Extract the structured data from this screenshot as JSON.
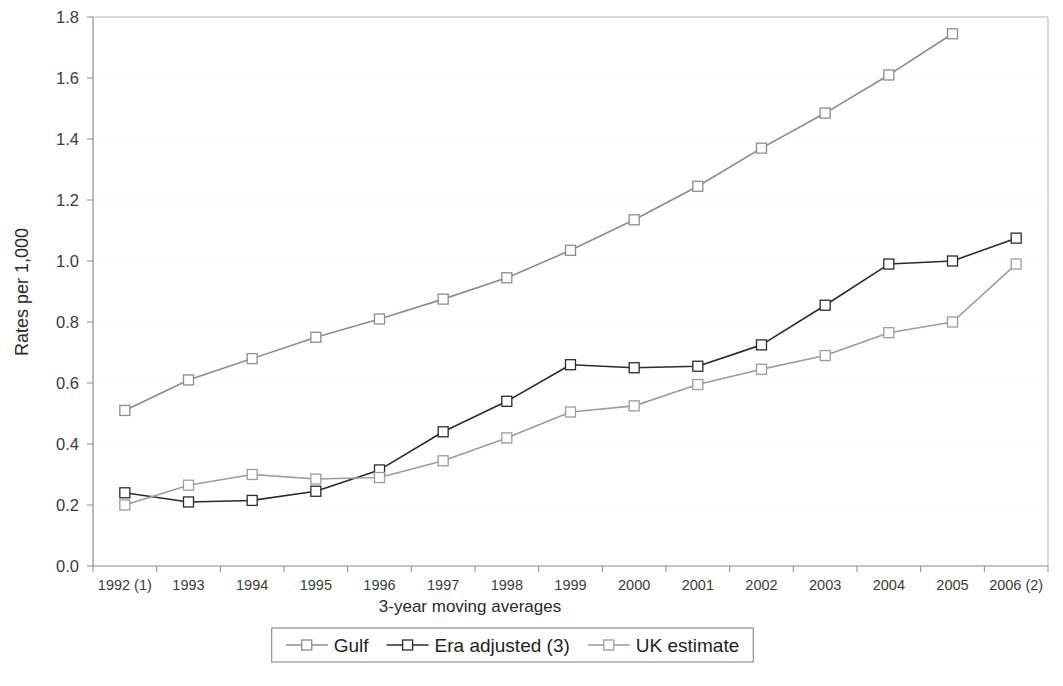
{
  "chart_data": {
    "type": "line",
    "title": "",
    "xlabel": "3-year moving averages",
    "ylabel": "Rates per 1,000",
    "categories": [
      "1992 (1)",
      "1993",
      "1994",
      "1995",
      "1996",
      "1997",
      "1998",
      "1999",
      "2000",
      "2001",
      "2002",
      "2003",
      "2004",
      "2005",
      "2006 (2)"
    ],
    "series": [
      {
        "name": "Gulf",
        "color": "#8c8c8c",
        "values": [
          0.51,
          0.61,
          0.68,
          0.75,
          0.81,
          0.875,
          0.945,
          1.035,
          1.135,
          1.245,
          1.37,
          1.485,
          1.61,
          1.745,
          null
        ]
      },
      {
        "name": "Era adjusted (3)",
        "color": "#2b2b2b",
        "values": [
          0.24,
          0.21,
          0.215,
          0.245,
          0.315,
          0.44,
          0.54,
          0.66,
          0.65,
          0.655,
          0.725,
          0.855,
          0.99,
          1.0,
          1.075
        ]
      },
      {
        "name": "UK estimate",
        "color": "#9c9c9c",
        "values": [
          0.2,
          0.265,
          0.3,
          0.285,
          0.29,
          0.345,
          0.42,
          0.505,
          0.525,
          0.595,
          0.645,
          0.69,
          0.765,
          0.8,
          0.99
        ]
      }
    ],
    "ylim": [
      0.0,
      1.8
    ],
    "ytick_step": 0.2,
    "ytick_labels": [
      "0.0",
      "0.2",
      "0.4",
      "0.6",
      "0.8",
      "1.0",
      "1.2",
      "1.4",
      "1.6",
      "1.8"
    ],
    "grid": "minor-horizontal",
    "legend_position": "bottom",
    "legend_entries": [
      "Gulf",
      "Era adjusted (3)",
      "UK estimate"
    ]
  },
  "axes": {
    "y_title": "Rates per 1,000",
    "x_title": "3-year moving averages"
  }
}
